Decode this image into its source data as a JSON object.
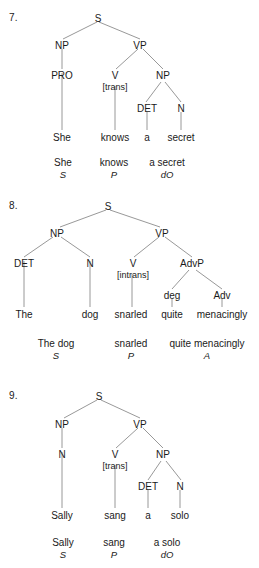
{
  "page": {
    "background_color": "#ffffff",
    "line_color": "#8c8c8c",
    "text_color": "#1a1a1a"
  },
  "exercises": [
    {
      "number": "7.",
      "sentence": "She knows a secret",
      "nodes": {
        "s": "S",
        "np_subject": "NP",
        "vp": "VP",
        "pro": "PRO",
        "v": "V",
        "v_feature": "[trans]",
        "np_object": "NP",
        "det": "DET",
        "n": "N"
      },
      "words": {
        "w1": "She",
        "w2": "knows",
        "w3": "a",
        "w4": "secret"
      },
      "summary": [
        {
          "phrase": "She",
          "role": "S"
        },
        {
          "phrase": "knows",
          "role": "P"
        },
        {
          "phrase": "a secret",
          "role": "dO"
        }
      ]
    },
    {
      "number": "8.",
      "sentence": "The dog snarled quite menacingly",
      "nodes": {
        "s": "S",
        "np_subject": "NP",
        "vp": "VP",
        "det": "DET",
        "n": "N",
        "v": "V",
        "v_feature": "[intrans]",
        "advp": "AdvP",
        "deg": "deg",
        "adv": "Adv"
      },
      "words": {
        "w1": "The",
        "w2": "dog",
        "w3": "snarled",
        "w4": "quite",
        "w5": "menacingly"
      },
      "summary": [
        {
          "phrase": "The dog",
          "role": "S"
        },
        {
          "phrase": "snarled",
          "role": "P"
        },
        {
          "phrase": "quite menacingly",
          "role": "A"
        }
      ]
    },
    {
      "number": "9.",
      "sentence": "Sally sang a solo",
      "nodes": {
        "s": "S",
        "np_subject": "NP",
        "vp": "VP",
        "n_subject": "N",
        "v": "V",
        "v_feature": "[trans]",
        "np_object": "NP",
        "det": "DET",
        "n": "N"
      },
      "words": {
        "w1": "Sally",
        "w2": "sang",
        "w3": "a",
        "w4": "solo"
      },
      "summary": [
        {
          "phrase": "Sally",
          "role": "S"
        },
        {
          "phrase": "sang",
          "role": "P"
        },
        {
          "phrase": "a solo",
          "role": "dO"
        }
      ]
    }
  ]
}
